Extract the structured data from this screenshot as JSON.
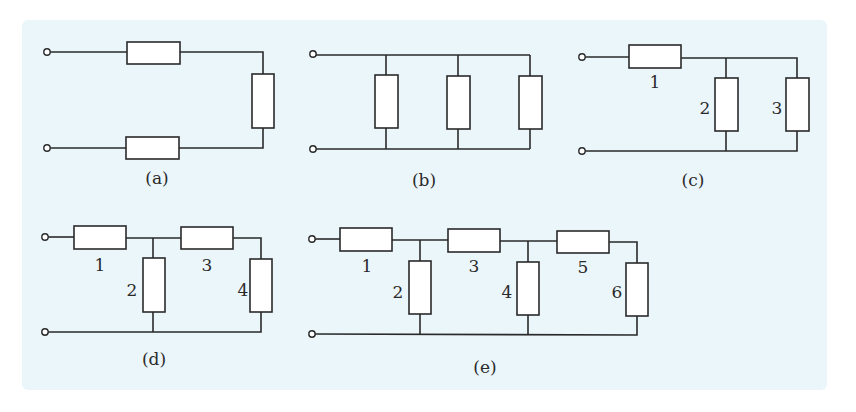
{
  "figure": {
    "background_color": "#eaf6fa",
    "line_color": "#2a2a2a",
    "diagrams": [
      {
        "id": "a",
        "caption": "(a)",
        "description": "Three resistors in series: top horizontal, right vertical, bottom horizontal",
        "resistor_labels": []
      },
      {
        "id": "b",
        "caption": "(b)",
        "description": "Three resistors in parallel between two rails",
        "resistor_labels": []
      },
      {
        "id": "c",
        "caption": "(c)",
        "description": "Resistor 1 in series with parallel pair 2 and 3",
        "resistor_labels": [
          "1",
          "2",
          "3"
        ]
      },
      {
        "id": "d",
        "caption": "(d)",
        "description": "Ladder network with two sections: series 1, shunt 2, series 3, shunt 4",
        "resistor_labels": [
          "1",
          "2",
          "3",
          "4"
        ]
      },
      {
        "id": "e",
        "caption": "(e)",
        "description": "Ladder network with three sections: series 1, shunt 2, series 3, shunt 4, series 5, shunt 6",
        "resistor_labels": [
          "1",
          "2",
          "3",
          "4",
          "5",
          "6"
        ]
      }
    ]
  }
}
